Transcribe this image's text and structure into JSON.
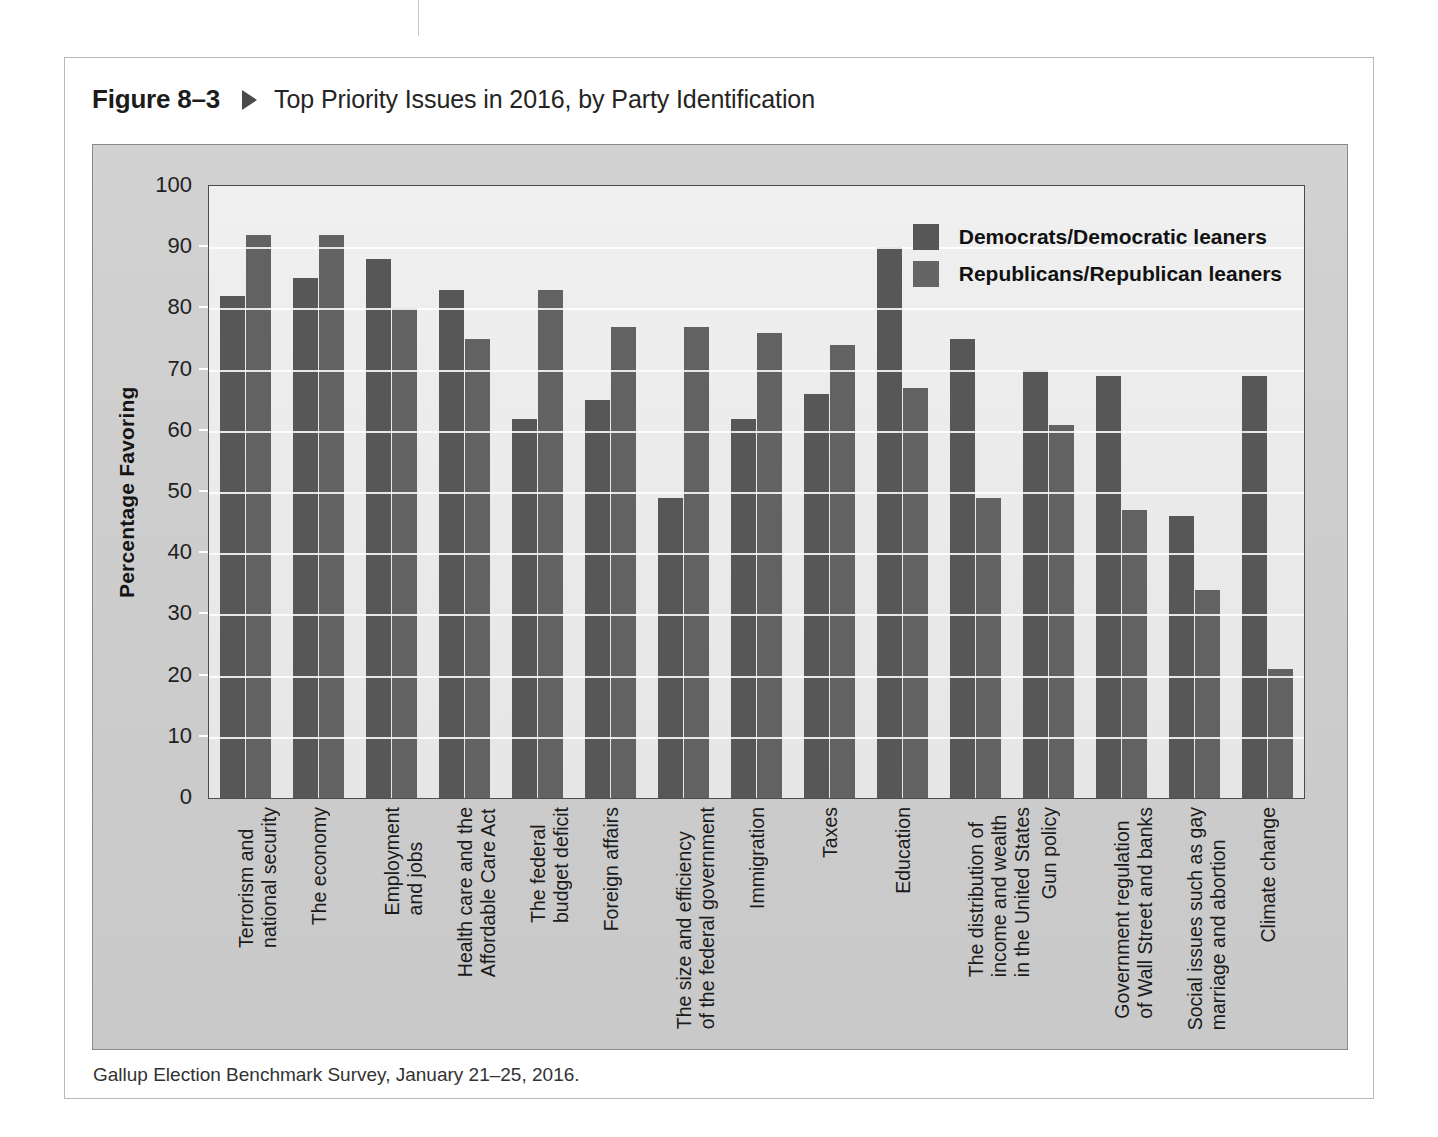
{
  "figure": {
    "number": "Figure 8–3",
    "title": "Top Priority Issues in 2016, by Party Identification",
    "source": "Gallup Election Benchmark Survey, January 21–25, 2016."
  },
  "colors": {
    "democrat_bar": "#575757",
    "republican_bar": "#626262",
    "plot_background": "#eaeaea",
    "panel_background": "#cdcdcd",
    "gridline": "#ffffff",
    "axis": "#4c4c4c"
  },
  "chart_data": {
    "type": "bar",
    "title": "Top Priority Issues in 2016, by Party Identification",
    "xlabel": "",
    "ylabel": "Percentage Favoring",
    "ylim": [
      0,
      100
    ],
    "yticks": [
      0,
      10,
      20,
      30,
      40,
      50,
      60,
      70,
      80,
      90,
      100
    ],
    "grid": true,
    "legend_position": "top-right",
    "categories": [
      "Terrorism and\nnational security",
      "The economy",
      "Employment\nand jobs",
      "Health care and the\nAffordable Care Act",
      "The federal\nbudget deficit",
      "Foreign affairs",
      "The size and efficiency\nof the federal government",
      "Immigration",
      "Taxes",
      "Education",
      "The distribution of\nincome and wealth\nin the United States",
      "Gun policy",
      "Government regulation\nof Wall Street and banks",
      "Social issues such as gay\nmarriage and abortion",
      "Climate change"
    ],
    "series": [
      {
        "name": "Democrats/Democratic leaners",
        "color": "#575757",
        "values": [
          82,
          85,
          88,
          83,
          62,
          65,
          49,
          62,
          66,
          90,
          75,
          70,
          69,
          46,
          69
        ]
      },
      {
        "name": "Republicans/Republican leaners",
        "color": "#626262",
        "values": [
          92,
          92,
          80,
          75,
          83,
          77,
          77,
          76,
          74,
          67,
          49,
          61,
          47,
          34,
          21
        ]
      }
    ]
  }
}
